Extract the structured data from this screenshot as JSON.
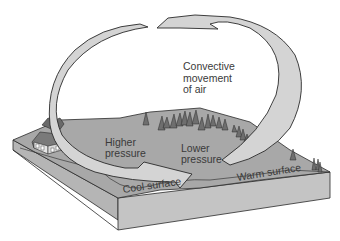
{
  "diagram": {
    "title_label": [
      "Convective",
      "movement",
      "of air"
    ],
    "labels": {
      "higher_pressure": [
        "Higher",
        "pressure"
      ],
      "lower_pressure": [
        "Lower",
        "pressure"
      ],
      "cool_surface": "Cool surface",
      "warm_surface": "Warm surface"
    },
    "colors": {
      "arrow_fill": "#d4d4d4",
      "arrow_stroke": "#2a2a2a",
      "ground_top": "#a9a9a9",
      "ground_side": "#bdbdbd",
      "ground_front": "#c6c6c6",
      "tree": "#6f6f6f",
      "text": "#3a3a3a"
    }
  }
}
